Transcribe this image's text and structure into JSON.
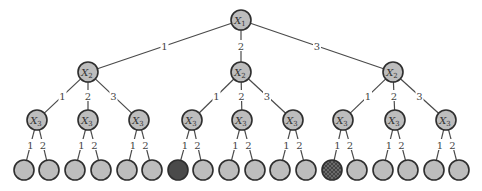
{
  "diagram": {
    "type": "decision-tree",
    "colors": {
      "node_fill": "#bdbdbd",
      "node_stroke": "#2e2e2e",
      "edge": "#4a4a4a",
      "leaf_dark": "#4a4a4a",
      "leaf_hatched": "#5a5a5a"
    },
    "root": {
      "var": "X",
      "sub": "1",
      "x": 241,
      "y": 20
    },
    "level2": [
      {
        "var": "X",
        "sub": "2",
        "x": 88,
        "y": 72,
        "edge_label": "1"
      },
      {
        "var": "X",
        "sub": "2",
        "x": 241,
        "y": 72,
        "edge_label": "2"
      },
      {
        "var": "X",
        "sub": "2",
        "x": 393,
        "y": 72,
        "edge_label": "3"
      }
    ],
    "level3": [
      {
        "var": "X",
        "sub": "3",
        "x": 37,
        "y": 120,
        "parent": 0,
        "edge_label": "1"
      },
      {
        "var": "X",
        "sub": "3",
        "x": 88,
        "y": 120,
        "parent": 0,
        "edge_label": "2"
      },
      {
        "var": "X",
        "sub": "3",
        "x": 139,
        "y": 120,
        "parent": 0,
        "edge_label": "3"
      },
      {
        "var": "X",
        "sub": "3",
        "x": 192,
        "y": 120,
        "parent": 1,
        "edge_label": "1"
      },
      {
        "var": "X",
        "sub": "3",
        "x": 242,
        "y": 120,
        "parent": 1,
        "edge_label": "2"
      },
      {
        "var": "X",
        "sub": "3",
        "x": 293,
        "y": 120,
        "parent": 1,
        "edge_label": "3"
      },
      {
        "var": "X",
        "sub": "3",
        "x": 343,
        "y": 120,
        "parent": 2,
        "edge_label": "1"
      },
      {
        "var": "X",
        "sub": "3",
        "x": 395,
        "y": 120,
        "parent": 2,
        "edge_label": "2"
      },
      {
        "var": "X",
        "sub": "3",
        "x": 446,
        "y": 120,
        "parent": 2,
        "edge_label": "3"
      }
    ],
    "leaves": [
      {
        "x": 24,
        "y": 170,
        "parent": 0,
        "edge_label": "1",
        "style": "normal"
      },
      {
        "x": 49,
        "y": 170,
        "parent": 0,
        "edge_label": "2",
        "style": "normal"
      },
      {
        "x": 75,
        "y": 170,
        "parent": 1,
        "edge_label": "1",
        "style": "normal"
      },
      {
        "x": 101,
        "y": 170,
        "parent": 1,
        "edge_label": "2",
        "style": "normal"
      },
      {
        "x": 127,
        "y": 170,
        "parent": 2,
        "edge_label": "1",
        "style": "normal"
      },
      {
        "x": 152,
        "y": 170,
        "parent": 2,
        "edge_label": "2",
        "style": "normal"
      },
      {
        "x": 178,
        "y": 170,
        "parent": 3,
        "edge_label": "1",
        "style": "dark"
      },
      {
        "x": 203,
        "y": 170,
        "parent": 3,
        "edge_label": "2",
        "style": "normal"
      },
      {
        "x": 229,
        "y": 170,
        "parent": 4,
        "edge_label": "1",
        "style": "normal"
      },
      {
        "x": 255,
        "y": 170,
        "parent": 4,
        "edge_label": "2",
        "style": "normal"
      },
      {
        "x": 280,
        "y": 170,
        "parent": 5,
        "edge_label": "1",
        "style": "normal"
      },
      {
        "x": 306,
        "y": 170,
        "parent": 5,
        "edge_label": "2",
        "style": "normal"
      },
      {
        "x": 332,
        "y": 170,
        "parent": 6,
        "edge_label": "1",
        "style": "hatched"
      },
      {
        "x": 357,
        "y": 170,
        "parent": 6,
        "edge_label": "2",
        "style": "normal"
      },
      {
        "x": 383,
        "y": 170,
        "parent": 7,
        "edge_label": "1",
        "style": "normal"
      },
      {
        "x": 408,
        "y": 170,
        "parent": 7,
        "edge_label": "2",
        "style": "normal"
      },
      {
        "x": 434,
        "y": 170,
        "parent": 8,
        "edge_label": "1",
        "style": "normal"
      },
      {
        "x": 459,
        "y": 170,
        "parent": 8,
        "edge_label": "2",
        "style": "normal"
      }
    ]
  }
}
